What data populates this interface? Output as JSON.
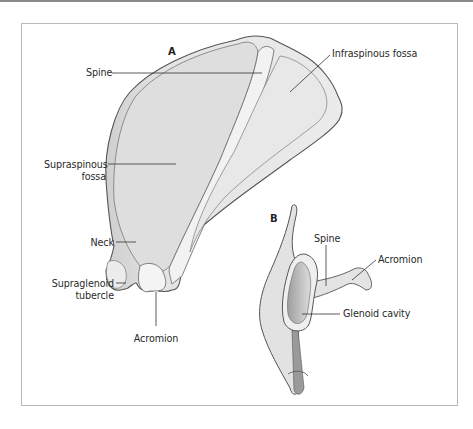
{
  "figure": {
    "panels": {
      "a": {
        "letter": "A"
      },
      "b": {
        "letter": "B"
      }
    },
    "labels_a": {
      "spine": "Spine",
      "infraspinous": "Infraspinous fossa",
      "supraspinous_1": "Supraspinous",
      "supraspinous_2": "fossa",
      "neck": "Neck",
      "supraglenoid_1": "Supraglenoid",
      "supraglenoid_2": "tubercle",
      "acromion": "Acromion"
    },
    "labels_b": {
      "spine": "Spine",
      "acromion": "Acromion",
      "glenoid": "Glenoid cavity"
    },
    "colors": {
      "bone_fill": "#e6e6e6",
      "bone_shadow": "#c9c9c9",
      "outline": "#555555",
      "leader": "#333333",
      "frame": "#b8b8b8"
    }
  }
}
